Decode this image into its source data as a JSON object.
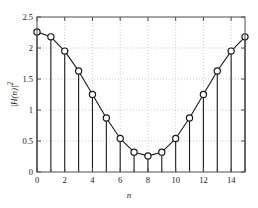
{
  "chart_data": {
    "type": "line",
    "title": "",
    "subtitle": "",
    "xlabel": "n",
    "ylabel": "|H(n)|²",
    "ylabel_parts": {
      "base": "|H(n)|",
      "exponent": "2"
    },
    "x": [
      0,
      1,
      2,
      3,
      4,
      5,
      6,
      7,
      8,
      9,
      10,
      11,
      12,
      13,
      14,
      15
    ],
    "values": [
      2.26,
      2.18,
      1.95,
      1.63,
      1.25,
      0.87,
      0.54,
      0.32,
      0.26,
      0.32,
      0.54,
      0.87,
      1.25,
      1.63,
      1.95,
      2.18
    ],
    "categories": [
      "0",
      "1",
      "2",
      "3",
      "4",
      "5",
      "6",
      "7",
      "8",
      "9",
      "10",
      "11",
      "12",
      "13",
      "14",
      "15"
    ],
    "xlim": [
      0,
      15
    ],
    "ylim": [
      0,
      2.5
    ],
    "xticks": [
      0,
      2,
      4,
      6,
      8,
      10,
      12,
      14
    ],
    "xtick_labels": [
      "0",
      "2",
      "4",
      "6",
      "8",
      "10",
      "12",
      "14"
    ],
    "yticks": [
      0,
      0.5,
      1,
      1.5,
      2,
      2.5
    ],
    "ytick_labels": [
      "0",
      "0.5",
      "1",
      "1.5",
      "2",
      "2.5"
    ],
    "grid": true,
    "grid_style": "dotted",
    "legend": null,
    "legend_position": "none",
    "marker": "circle-open",
    "stem_plot": true,
    "colors": {
      "line": "#1a1a1a",
      "marker_edge": "#1a1a1a",
      "marker_face": "#ffffff",
      "stem": "#1a1a1a",
      "axis": "#4d4d4d",
      "grid": "#b3b3b3",
      "background": "#ffffff",
      "text": "#1a1a1a"
    }
  }
}
